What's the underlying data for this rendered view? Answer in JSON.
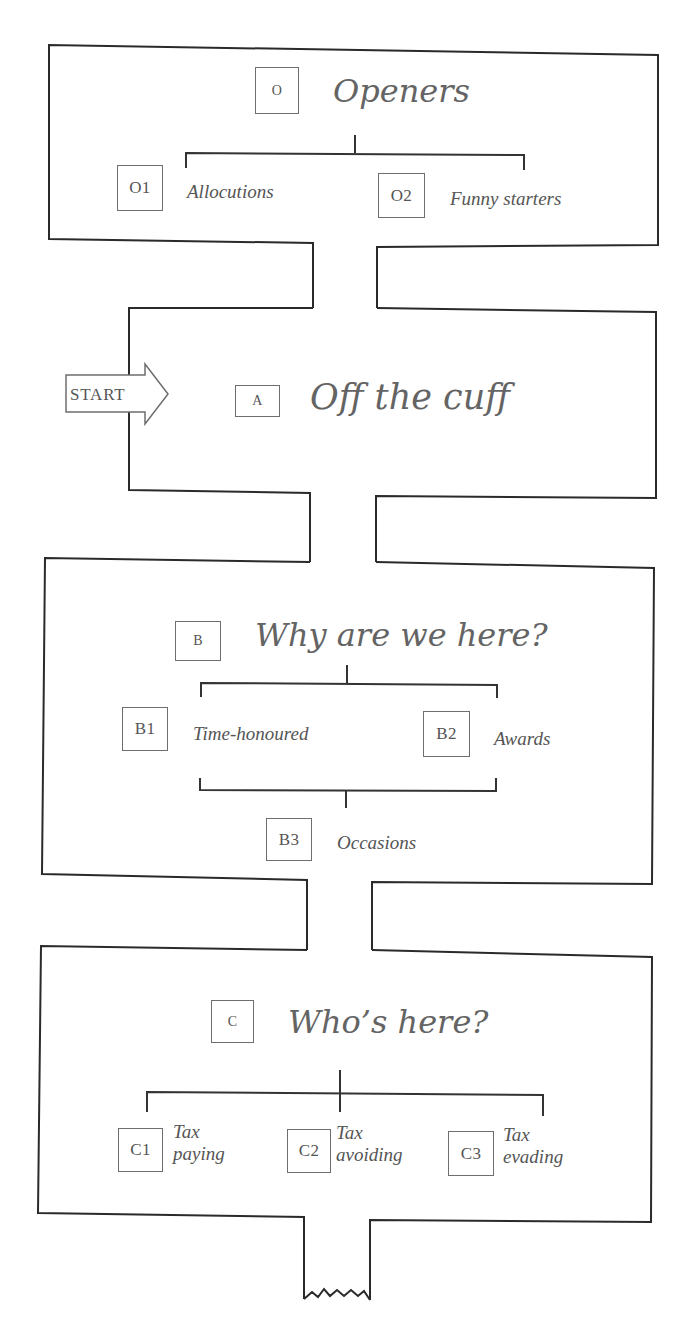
{
  "diagram": {
    "start_label": "START",
    "sections": [
      {
        "id": "O",
        "code": "O",
        "title": "Openers",
        "children": [
          {
            "code": "O1",
            "label": "Allocutions"
          },
          {
            "code": "O2",
            "label": "Funny starters"
          }
        ]
      },
      {
        "id": "A",
        "code": "A",
        "title": "Off the cuff",
        "children": []
      },
      {
        "id": "B",
        "code": "B",
        "title": "Why are we here?",
        "children": [
          {
            "code": "B1",
            "label": "Time-honoured"
          },
          {
            "code": "B2",
            "label": "Awards"
          },
          {
            "code": "B3",
            "label": "Occasions"
          }
        ]
      },
      {
        "id": "C",
        "code": "C",
        "title": "Who’s here?",
        "children": [
          {
            "code": "C1",
            "label_line1": "Tax",
            "label_line2": "paying"
          },
          {
            "code": "C2",
            "label_line1": "Tax",
            "label_line2": "avoiding"
          },
          {
            "code": "C3",
            "label_line1": "Tax",
            "label_line2": "evading"
          }
        ]
      }
    ],
    "colors": {
      "outline": "#2a2a2a",
      "box_border": "#6e6e6e",
      "text": "#555555",
      "title_text": "#646464",
      "background": "#ffffff"
    }
  }
}
